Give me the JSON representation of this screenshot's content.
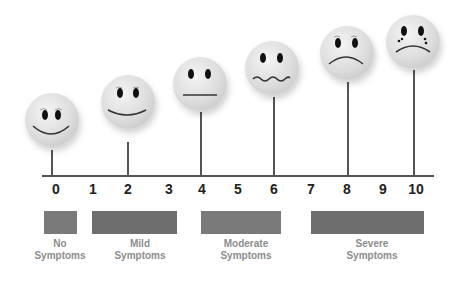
{
  "scale": {
    "ticks": [
      "0",
      "1",
      "2",
      "3",
      "4",
      "5",
      "6",
      "7",
      "8",
      "9",
      "10"
    ],
    "tick_x": [
      56,
      93,
      128,
      169,
      202,
      238,
      274,
      311,
      347,
      383,
      416
    ]
  },
  "faces": [
    {
      "level": "0",
      "expression": "big-smile"
    },
    {
      "level": "2",
      "expression": "smile"
    },
    {
      "level": "4",
      "expression": "neutral"
    },
    {
      "level": "6",
      "expression": "wavy"
    },
    {
      "level": "8",
      "expression": "frown"
    },
    {
      "level": "10",
      "expression": "crying-frown"
    }
  ],
  "categories": [
    {
      "line1": "No",
      "line2": "Symptoms",
      "range": "0"
    },
    {
      "line1": "Mild",
      "line2": "Symptoms",
      "range": "1-3"
    },
    {
      "line1": "Moderate",
      "line2": "Symptoms",
      "range": "4-6"
    },
    {
      "line1": "Severe",
      "line2": "Symptoms",
      "range": "7-10"
    }
  ],
  "colors": {
    "bar": "#6e6e6e",
    "label": "#8c8c8c",
    "axis": "#555555"
  }
}
